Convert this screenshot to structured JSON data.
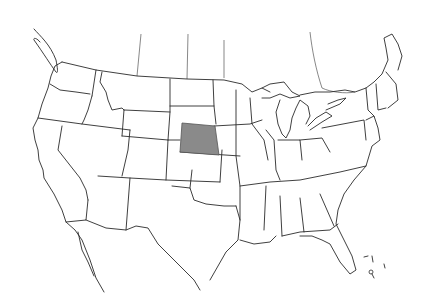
{
  "map": {
    "type": "outline map",
    "region": "United States (contiguous) with Canada/Mexico borders",
    "highlighted_region": {
      "label": "highlighted-state",
      "fill": "#8a8a8a",
      "stroke": "#555555",
      "polygon": [
        [
          182,
          123
        ],
        [
          215,
          126
        ],
        [
          219,
          155
        ],
        [
          180,
          152
        ]
      ]
    },
    "colors": {
      "background": "#ffffff",
      "lines": "#2a2a2a"
    }
  }
}
